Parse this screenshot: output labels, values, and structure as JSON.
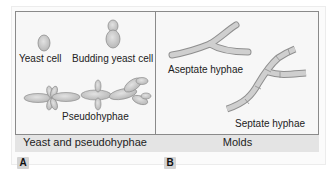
{
  "panels": {
    "a": {
      "tag": "A",
      "caption": "Yeast and pseudohyphae",
      "labels": {
        "yeast_cell": "Yeast cell",
        "budding_yeast_cell": "Budding yeast cell",
        "pseudohyphae": "Pseudohyphae"
      }
    },
    "b": {
      "tag": "B",
      "caption": "Molds",
      "labels": {
        "aseptate_hyphae": "Aseptate hyphae",
        "septate_hyphae": "Septate hyphae"
      }
    }
  },
  "colors": {
    "cell_fill": "#c9c9c9",
    "cell_stroke": "#8f8f8f",
    "border": "#8a8a8a",
    "band": "#e4e4e4"
  }
}
